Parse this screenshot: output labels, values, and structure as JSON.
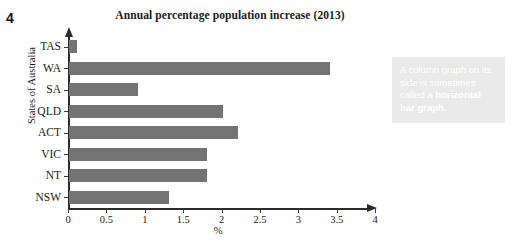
{
  "question_number": "4",
  "callout": {
    "text_before": "A column graph on its side is sometimes called a ",
    "text_bold": "horizontal bar graph",
    "text_after": "."
  },
  "chart_data": {
    "type": "bar",
    "orientation": "horizontal",
    "title": "Annual percentage population increase (2013)",
    "xlabel": "%",
    "ylabel": "States of Australia",
    "categories": [
      "TAS",
      "WA",
      "SA",
      "QLD",
      "ACT",
      "VIC",
      "NT",
      "NSW"
    ],
    "values": [
      0.1,
      3.4,
      0.9,
      2.0,
      2.2,
      1.8,
      1.8,
      1.3
    ],
    "xlim": [
      0,
      4
    ],
    "xticks": [
      0,
      0.5,
      1,
      1.5,
      2,
      2.5,
      3,
      3.5,
      4
    ],
    "xtick_labels": [
      "0",
      "0.5",
      "1",
      "1.5",
      "2",
      "2.5",
      "3",
      "3.5",
      "4"
    ],
    "grid": false,
    "legend": false,
    "bar_color": "#737373",
    "axis_color": "#2b2b2b"
  }
}
